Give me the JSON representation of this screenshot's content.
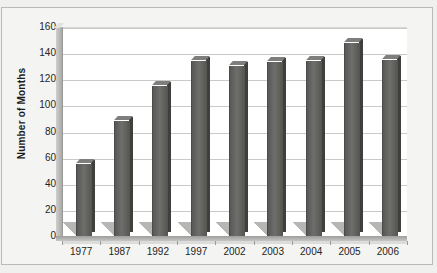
{
  "chart_data": {
    "type": "bar",
    "title": "",
    "subtitle": "",
    "xlabel": "",
    "ylabel": "Number of Months",
    "categories": [
      "1977",
      "1987",
      "1992",
      "1997",
      "2002",
      "2003",
      "2004",
      "2005",
      "2006"
    ],
    "values": [
      55,
      88,
      115,
      134,
      130,
      133,
      134,
      148,
      135
    ],
    "series": [
      {
        "name": "Number of Months",
        "values": [
          55,
          88,
          115,
          134,
          130,
          133,
          134,
          148,
          135
        ]
      }
    ],
    "ylim": [
      0,
      160
    ],
    "ytick_labels": [
      "0",
      "20",
      "40",
      "60",
      "80",
      "100",
      "120",
      "140",
      "160"
    ],
    "ytick_values": [
      0,
      20,
      40,
      60,
      80,
      100,
      120,
      140,
      160
    ],
    "grid": "horizontal",
    "legend": "none",
    "style": "3d-bar",
    "colors": {
      "bar_face": "#6e6e6c",
      "bar_side": "#3f3f3d",
      "bar_top": "#7e7e7c",
      "bar_shadow": "#b6b6b4",
      "gridline": "#c9c9c7",
      "plot_background": "#ffffff",
      "figure_background": "#f0f0ee",
      "axis": "#8f8f8d",
      "text": "#242424"
    }
  }
}
